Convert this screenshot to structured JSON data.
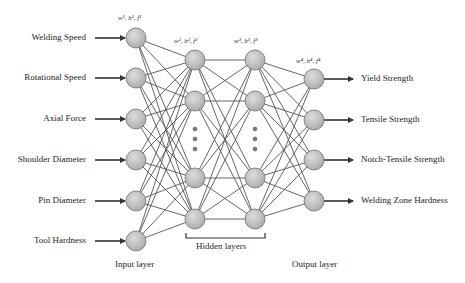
{
  "diagram": {
    "inputs": [
      {
        "label": "Welding Speed",
        "y": 38
      },
      {
        "label": "Rotational Speed",
        "y": 78
      },
      {
        "label": "Axial Force",
        "y": 119
      },
      {
        "label": "Shoulder Diameter",
        "y": 160
      },
      {
        "label": "Pin Diameter",
        "y": 201
      },
      {
        "label": "Tool Hardness",
        "y": 241
      }
    ],
    "hidden1": {
      "x": 195,
      "ys": [
        60,
        101,
        178,
        219
      ],
      "dots_y": [
        129,
        139,
        149
      ]
    },
    "hidden2": {
      "x": 255,
      "ys": [
        60,
        101,
        178,
        219
      ],
      "dots_y": [
        129,
        139,
        149
      ]
    },
    "input_x": 136,
    "output_x": 314,
    "outputs": [
      {
        "label": "Yield Strength",
        "y": 79
      },
      {
        "label": "Tensile Strength",
        "y": 120
      },
      {
        "label": "Notch-Tensile Strength",
        "y": 160
      },
      {
        "label": "Welding Zone Hardness",
        "y": 201
      }
    ],
    "weight_labels": {
      "layer1": "w¹, b¹, f¹",
      "layer2": "w², b², f²",
      "layer3": "w³, b³, f³",
      "layer4": "w⁴, b⁴, f⁴"
    },
    "layer_labels": {
      "input": "Input layer",
      "hidden": "Hidden layers",
      "output": "Output layer"
    },
    "colors": {
      "node_fill": "#c4c4c4",
      "node_stroke": "#6f6f6f",
      "edge": "#555555",
      "text": "#1e1e1e"
    },
    "node_radius": 10
  }
}
